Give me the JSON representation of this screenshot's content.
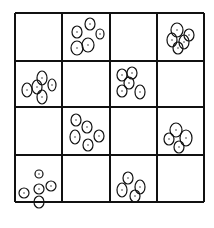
{
  "diagram": {
    "type": "grid-with-oval-clusters",
    "rows": 4,
    "cols": 4,
    "colors": {
      "line": "#111111",
      "background": "#ffffff"
    },
    "grid": {
      "x": [
        15,
        62,
        110,
        157,
        204
      ],
      "y": [
        13,
        61,
        107,
        155,
        202
      ]
    },
    "cells": [
      {
        "row": 0,
        "col": 0,
        "count": 0,
        "ovals": []
      },
      {
        "row": 0,
        "col": 1,
        "count": 5,
        "ovals": [
          [
            77,
            32,
            5,
            6
          ],
          [
            90,
            24,
            5,
            6
          ],
          [
            100,
            34,
            4,
            5
          ],
          [
            77,
            48,
            6,
            7
          ],
          [
            88,
            45,
            6,
            7
          ]
        ]
      },
      {
        "row": 0,
        "col": 2,
        "count": 0,
        "ovals": []
      },
      {
        "row": 0,
        "col": 3,
        "count": 5,
        "ovals": [
          [
            177,
            30,
            6,
            7
          ],
          [
            172,
            40,
            5,
            7
          ],
          [
            184,
            42,
            5,
            7
          ],
          [
            178,
            48,
            5,
            6
          ],
          [
            189,
            35,
            5,
            6
          ]
        ]
      },
      {
        "row": 1,
        "col": 0,
        "count": 5,
        "ovals": [
          [
            27,
            90,
            5,
            7
          ],
          [
            37,
            87,
            5,
            7
          ],
          [
            42,
            78,
            5,
            7
          ],
          [
            52,
            85,
            4,
            6
          ],
          [
            42,
            97,
            5,
            7
          ]
        ]
      },
      {
        "row": 1,
        "col": 1,
        "count": 0,
        "ovals": []
      },
      {
        "row": 1,
        "col": 2,
        "count": 5,
        "ovals": [
          [
            122,
            75,
            5,
            6
          ],
          [
            132,
            73,
            5,
            6
          ],
          [
            129,
            83,
            5,
            6
          ],
          [
            122,
            91,
            5,
            6
          ],
          [
            140,
            92,
            5,
            7
          ]
        ]
      },
      {
        "row": 1,
        "col": 3,
        "count": 0,
        "ovals": []
      },
      {
        "row": 2,
        "col": 0,
        "count": 0,
        "ovals": []
      },
      {
        "row": 2,
        "col": 1,
        "count": 5,
        "ovals": [
          [
            76,
            120,
            5,
            6
          ],
          [
            87,
            127,
            5,
            6
          ],
          [
            99,
            136,
            5,
            6
          ],
          [
            75,
            137,
            5,
            7
          ],
          [
            88,
            145,
            5,
            6
          ]
        ]
      },
      {
        "row": 2,
        "col": 2,
        "count": 0,
        "ovals": []
      },
      {
        "row": 2,
        "col": 3,
        "count": 4,
        "ovals": [
          [
            176,
            130,
            6,
            7
          ],
          [
            169,
            139,
            5,
            6
          ],
          [
            186,
            138,
            6,
            8
          ],
          [
            179,
            147,
            5,
            6
          ]
        ]
      },
      {
        "row": 3,
        "col": 0,
        "count": 5,
        "ovals": [
          [
            39,
            174,
            4,
            4
          ],
          [
            24,
            193,
            5,
            5
          ],
          [
            39,
            189,
            5,
            5
          ],
          [
            51,
            186,
            5,
            5
          ],
          [
            39,
            202,
            5,
            6
          ]
        ]
      },
      {
        "row": 3,
        "col": 1,
        "count": 0,
        "ovals": []
      },
      {
        "row": 3,
        "col": 2,
        "count": 4,
        "ovals": [
          [
            128,
            178,
            5,
            6
          ],
          [
            122,
            190,
            5,
            7
          ],
          [
            140,
            187,
            5,
            7
          ],
          [
            135,
            196,
            5,
            6
          ]
        ]
      },
      {
        "row": 3,
        "col": 3,
        "count": 0,
        "ovals": []
      }
    ]
  }
}
